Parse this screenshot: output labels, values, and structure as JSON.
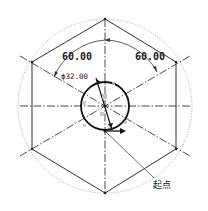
{
  "diagram": {
    "type": "cad-sketch",
    "dimensions": {
      "angle_left": "60.00",
      "angle_right": "60.00",
      "diameter": "ϕ32.00"
    },
    "annotations": {
      "start_point": "起点"
    },
    "colors": {
      "line": "#222222",
      "construction": "#555555",
      "dotted_circle": "#888888",
      "background": "#ffffff"
    }
  }
}
